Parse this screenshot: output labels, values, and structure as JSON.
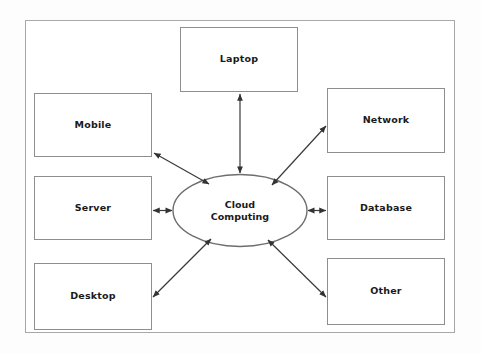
{
  "diagram": {
    "type": "hub-and-spoke",
    "title": "Cloud Computing",
    "hub": {
      "id": "cloud-computing",
      "shape": "ellipse",
      "label_line1": "Cloud",
      "label_line2": "Computing",
      "center": {
        "x": 240,
        "y": 210
      },
      "size": {
        "width": 136,
        "height": 73
      }
    },
    "nodes": [
      {
        "id": "laptop",
        "label": "Laptop",
        "shape": "rectangle",
        "position": {
          "x": 180,
          "y": 27,
          "width": 118,
          "height": 65
        },
        "connector": "vertical-top"
      },
      {
        "id": "mobile",
        "label": "Mobile",
        "shape": "rectangle",
        "position": {
          "x": 34,
          "y": 93,
          "width": 118,
          "height": 64
        },
        "connector": "diagonal-upper-left"
      },
      {
        "id": "server",
        "label": "Server",
        "shape": "rectangle",
        "position": {
          "x": 34,
          "y": 176,
          "width": 118,
          "height": 64
        },
        "connector": "horizontal-left"
      },
      {
        "id": "desktop",
        "label": "Desktop",
        "shape": "rectangle",
        "position": {
          "x": 34,
          "y": 263,
          "width": 118,
          "height": 67
        },
        "connector": "diagonal-lower-left"
      },
      {
        "id": "network",
        "label": "Network",
        "shape": "rectangle",
        "position": {
          "x": 327,
          "y": 88,
          "width": 118,
          "height": 65
        },
        "connector": "diagonal-upper-right"
      },
      {
        "id": "database",
        "label": "Database",
        "shape": "rectangle",
        "position": {
          "x": 327,
          "y": 176,
          "width": 118,
          "height": 64
        },
        "connector": "horizontal-right"
      },
      {
        "id": "other",
        "label": "Other",
        "shape": "rectangle",
        "position": {
          "x": 327,
          "y": 258,
          "width": 118,
          "height": 67
        },
        "connector": "diagonal-lower-right"
      }
    ],
    "edges": [
      {
        "from": "cloud-computing",
        "to": "laptop",
        "style": "double-arrow"
      },
      {
        "from": "cloud-computing",
        "to": "mobile",
        "style": "double-arrow"
      },
      {
        "from": "cloud-computing",
        "to": "server",
        "style": "double-arrow"
      },
      {
        "from": "cloud-computing",
        "to": "desktop",
        "style": "double-arrow"
      },
      {
        "from": "cloud-computing",
        "to": "network",
        "style": "double-arrow"
      },
      {
        "from": "cloud-computing",
        "to": "database",
        "style": "double-arrow"
      },
      {
        "from": "cloud-computing",
        "to": "other",
        "style": "double-arrow"
      }
    ],
    "colors": {
      "background": "#ffffff",
      "frame_border": "#a8a8a8",
      "node_border": "#8e8e8e",
      "hub_border": "#6e6e6e",
      "connector": "#4a4a4a",
      "text": "#1a1a1a"
    }
  }
}
